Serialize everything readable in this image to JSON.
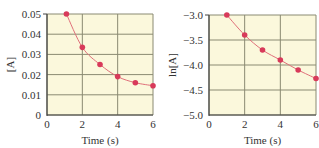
{
  "colors": {
    "plot_bg": "#fbf8dc",
    "grid": "#8a8a72",
    "axis": "#444444",
    "line": "#e0707a",
    "marker": "#d83a5a"
  },
  "chart_data": [
    {
      "type": "line",
      "title": "",
      "xlabel": "Time (s)",
      "ylabel": "[A]",
      "xlim": [
        0,
        6
      ],
      "ylim": [
        0,
        0.05
      ],
      "xticks": [
        "0",
        "2",
        "4",
        "6"
      ],
      "yticks": [
        "0",
        "0.01",
        "0.02",
        "0.03",
        "0.04",
        "0.05"
      ],
      "grid": true,
      "x": [
        1.1,
        2,
        3,
        4,
        5,
        6
      ],
      "series": [
        {
          "name": "[A]",
          "values": [
            0.05,
            0.0335,
            0.025,
            0.019,
            0.016,
            0.0145
          ]
        }
      ]
    },
    {
      "type": "line",
      "title": "",
      "xlabel": "Time (s)",
      "ylabel": "ln[A]",
      "xlim": [
        0,
        6
      ],
      "ylim": [
        -5.0,
        -3.0
      ],
      "xticks": [
        "0",
        "2",
        "4",
        "6"
      ],
      "yticks": [
        "−5.0",
        "−4.5",
        "−4.0",
        "−3.5",
        "−3.0"
      ],
      "grid": true,
      "x": [
        1,
        2,
        3,
        4,
        5,
        6
      ],
      "series": [
        {
          "name": "ln[A]",
          "values": [
            -3.0,
            -3.4,
            -3.7,
            -3.9,
            -4.1,
            -4.27
          ]
        }
      ]
    }
  ]
}
